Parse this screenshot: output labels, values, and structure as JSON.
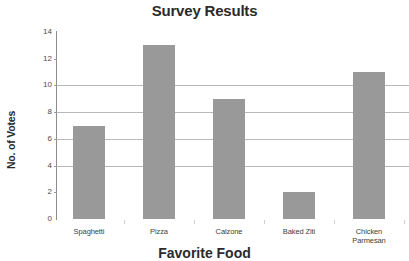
{
  "chart_data": {
    "type": "bar",
    "title": "Survey Results",
    "xlabel": "Favorite Food",
    "ylabel": "No. of Votes",
    "categories": [
      "Spaghetti",
      "Pizza",
      "Calzone",
      "Baked Ziti",
      "Chicken Parmesan"
    ],
    "category_lines": [
      [
        "Spaghetti"
      ],
      [
        "Pizza"
      ],
      [
        "Calzone"
      ],
      [
        "Baked Ziti"
      ],
      [
        "Chicken",
        "Parmesan"
      ]
    ],
    "values": [
      7,
      13,
      9,
      2,
      11
    ],
    "ylim": [
      0,
      14
    ],
    "yticks": [
      0,
      2,
      4,
      6,
      8,
      10,
      12,
      14
    ],
    "ytick_labels": [
      "0",
      "2",
      "4",
      "6",
      "8",
      "10",
      "12",
      "14"
    ],
    "gridlines_at": [
      4,
      6,
      8,
      10
    ],
    "grid": true,
    "legend": "none",
    "bar_color": "#999999",
    "gridline_color": "#b9b9b9",
    "axis_color": "#8d8d8d",
    "text_color": "#2b2b2b",
    "background": "#ffffff"
  }
}
